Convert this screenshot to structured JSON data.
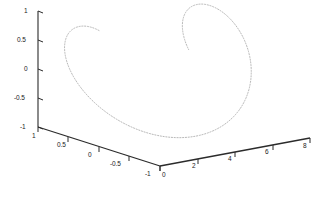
{
  "figure": {
    "background_color": "#ffffff",
    "axis_color": "#2b2b2b",
    "curve_color": "#b0b0b0",
    "tick_label_color": "#1a1a1a",
    "title": ""
  },
  "chart_data": {
    "type": "line",
    "title": "",
    "projection": "3d",
    "xlabel": "",
    "ylabel": "",
    "zlabel": "",
    "xlim": [
      0,
      8
    ],
    "ylim": [
      -1,
      1
    ],
    "zlim": [
      -1,
      1
    ],
    "grid": false,
    "legend": null,
    "line_style": "dotted",
    "line_color": "#b0b0b0",
    "xticks": [
      0,
      2,
      4,
      6,
      8
    ],
    "xtick_labels": [
      "0",
      "2",
      "4",
      "6",
      "8"
    ],
    "yticks": [
      1,
      0.5,
      0,
      -0.5,
      -1
    ],
    "ytick_labels": [
      "1",
      "0.5",
      "0",
      "-0.5",
      "-1"
    ],
    "zticks": [
      1,
      0.5,
      0,
      -0.5,
      -1
    ],
    "ztick_labels": [
      "1",
      "0.5",
      "0",
      "-0.5",
      "-1"
    ],
    "series": [
      {
        "name": "helix",
        "parametric": true,
        "description": "x = t, y = sin(t), z = cos(t) for t in [0, 8]",
        "x": [
          0.0,
          0.25,
          0.5,
          0.75,
          1.0,
          1.25,
          1.5,
          1.75,
          2.0,
          2.25,
          2.5,
          2.75,
          3.0,
          3.25,
          3.5,
          3.75,
          4.0,
          4.25,
          4.5,
          4.75,
          5.0,
          5.25,
          5.5,
          5.75,
          6.0,
          6.25,
          6.5,
          6.75,
          7.0,
          7.25,
          7.5,
          7.75,
          8.0
        ],
        "y": [
          0.0,
          0.247,
          0.479,
          0.682,
          0.841,
          0.949,
          0.997,
          0.984,
          0.909,
          0.778,
          0.598,
          0.382,
          0.141,
          -0.108,
          -0.351,
          -0.572,
          -0.757,
          -0.895,
          -0.978,
          -0.999,
          -0.959,
          -0.858,
          -0.706,
          -0.513,
          -0.279,
          -0.034,
          0.215,
          0.452,
          0.657,
          0.818,
          0.938,
          0.993,
          0.989
        ],
        "z": [
          1.0,
          0.969,
          0.878,
          0.732,
          0.54,
          0.315,
          0.071,
          -0.178,
          -0.416,
          -0.628,
          -0.801,
          -0.924,
          -0.99,
          -0.994,
          -0.936,
          -0.821,
          -0.654,
          -0.447,
          -0.211,
          0.038,
          0.284,
          0.513,
          0.709,
          0.859,
          0.96,
          0.999,
          0.977,
          0.892,
          0.754,
          0.575,
          0.347,
          0.115,
          -0.146
        ]
      }
    ]
  },
  "axes": {
    "z_axis": {
      "name": "z-axis",
      "ticks": [
        {
          "label": "1",
          "x": 24,
          "y": 8
        },
        {
          "label": "0.5",
          "x": 17,
          "y": 37
        },
        {
          "label": "0",
          "x": 24,
          "y": 66
        },
        {
          "label": "-0.5",
          "x": 14,
          "y": 95
        },
        {
          "label": "-1",
          "x": 20,
          "y": 124
        }
      ]
    },
    "y_axis": {
      "name": "y-axis",
      "ticks": [
        {
          "label": "1",
          "x": 32,
          "y": 133
        },
        {
          "label": "0.5",
          "x": 57,
          "y": 142
        },
        {
          "label": "0",
          "x": 88,
          "y": 152
        },
        {
          "label": "-0.5",
          "x": 110,
          "y": 161
        },
        {
          "label": "-1",
          "x": 145,
          "y": 171
        }
      ]
    },
    "x_axis": {
      "name": "x-axis",
      "ticks": [
        {
          "label": "0",
          "x": 162,
          "y": 172
        },
        {
          "label": "2",
          "x": 192,
          "y": 163
        },
        {
          "label": "4",
          "x": 228,
          "y": 156
        },
        {
          "label": "6",
          "x": 265,
          "y": 149
        },
        {
          "label": "8",
          "x": 303,
          "y": 143
        }
      ]
    }
  }
}
